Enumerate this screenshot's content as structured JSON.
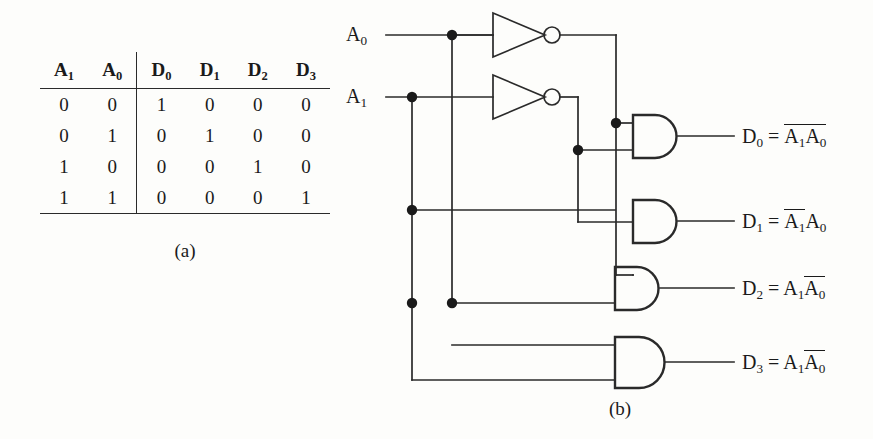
{
  "figure": {
    "part_a_caption": "(a)",
    "part_b_caption": "(b)"
  },
  "truth_table": {
    "input_headers": [
      "A₁",
      "A₀"
    ],
    "output_headers": [
      "D₀",
      "D₁",
      "D₂",
      "D₃"
    ],
    "header_plain": {
      "a1": "A",
      "a1_sub": "1",
      "a0": "A",
      "a0_sub": "0",
      "d0": "D",
      "d0_sub": "0",
      "d1": "D",
      "d1_sub": "1",
      "d2": "D",
      "d2_sub": "2",
      "d3": "D",
      "d3_sub": "3"
    },
    "rows": [
      {
        "inputs": [
          "0",
          "0"
        ],
        "outputs": [
          "1",
          "0",
          "0",
          "0"
        ]
      },
      {
        "inputs": [
          "0",
          "1"
        ],
        "outputs": [
          "0",
          "1",
          "0",
          "0"
        ]
      },
      {
        "inputs": [
          "1",
          "0"
        ],
        "outputs": [
          "0",
          "0",
          "1",
          "0"
        ]
      },
      {
        "inputs": [
          "1",
          "1"
        ],
        "outputs": [
          "0",
          "0",
          "0",
          "1"
        ]
      }
    ]
  },
  "circuit": {
    "inputs": [
      {
        "name": "A",
        "sub": "0"
      },
      {
        "name": "A",
        "sub": "1"
      }
    ],
    "gates": {
      "inverter_count": 2,
      "and_gate_count": 4
    },
    "outputs": [
      {
        "label": "D",
        "label_sub": "0",
        "eq_prefix": "=",
        "term1": "A",
        "term1_sub": "1",
        "term1_bar": true,
        "term2": "A",
        "term2_sub": "0",
        "term2_bar": true
      },
      {
        "label": "D",
        "label_sub": "1",
        "eq_prefix": "=",
        "term1": "A",
        "term1_sub": "1",
        "term1_bar": true,
        "term2": "A",
        "term2_sub": "0",
        "term2_bar": false
      },
      {
        "label": "D",
        "label_sub": "2",
        "eq_prefix": "=",
        "term1": "A",
        "term1_sub": "1",
        "term1_bar": false,
        "term2": "A",
        "term2_sub": "0",
        "term2_bar": true
      },
      {
        "label": "D",
        "label_sub": "3",
        "eq_prefix": "=",
        "term1": "A",
        "term1_sub": "1",
        "term1_bar": false,
        "term2": "A",
        "term2_sub": "0",
        "term2_bar": true
      }
    ]
  },
  "colors": {
    "ink": "#1a1a1a",
    "wire": "#2a2a2a",
    "background": "#fdfdfb"
  }
}
